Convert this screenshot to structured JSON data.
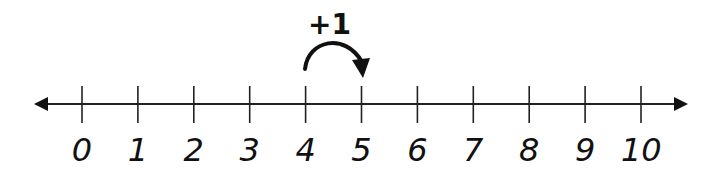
{
  "number_line": {
    "min": 0,
    "max": 10,
    "labels": [
      "0",
      "1",
      "2",
      "3",
      "4",
      "5",
      "6",
      "7",
      "8",
      "9",
      "10"
    ],
    "arrows": "both-ends"
  },
  "jump": {
    "label": "+1",
    "from": 4,
    "to": 5
  },
  "colors": {
    "ink": "#111111",
    "background": "#ffffff"
  }
}
